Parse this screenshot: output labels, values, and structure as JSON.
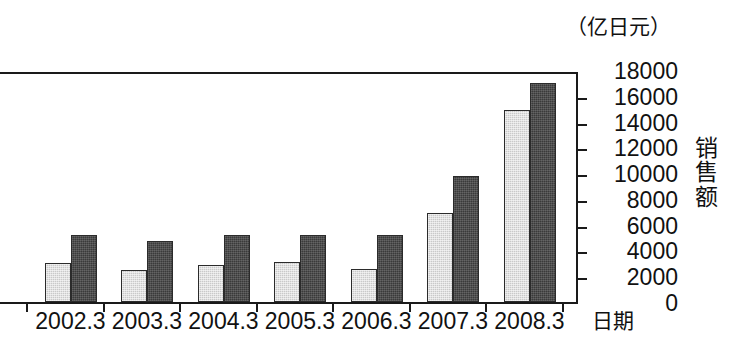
{
  "chart_data": {
    "type": "bar",
    "title": "",
    "unit_caption": "（亿日元）",
    "xlabel": "日期",
    "ylabel": "销售额",
    "categories": [
      "2001.3",
      "2002.3",
      "2003.3",
      "2004.3",
      "2005.3",
      "2006.3",
      "2007.3",
      "2008.3"
    ],
    "visible_tick_labels": [
      "3",
      "2002.3",
      "2003.3",
      "2004.3",
      "2005.3",
      "2006.3",
      "2007.3",
      "2008.3"
    ],
    "series": [
      {
        "name": "light-series",
        "color": "#c9c9c9",
        "values": [
          null,
          3000,
          2500,
          2900,
          3100,
          2600,
          6900,
          14900
        ]
      },
      {
        "name": "dark-series",
        "color": "#3a3a3a",
        "values": [
          null,
          5200,
          4700,
          5200,
          5200,
          5200,
          9800,
          17000
        ]
      }
    ],
    "ytick_labels": [
      "18000",
      "16000",
      "14000",
      "12000",
      "10000",
      "8000",
      "6000",
      "4000",
      "2000",
      "0"
    ],
    "ytick_values": [
      18000,
      16000,
      14000,
      12000,
      10000,
      8000,
      6000,
      4000,
      2000,
      0
    ],
    "ylim": [
      0,
      18000
    ],
    "y_axis_position": "right",
    "grid": false,
    "legend": "none",
    "note": "Left edge of the figure is cropped; the first date label is only partially visible as '3'."
  }
}
